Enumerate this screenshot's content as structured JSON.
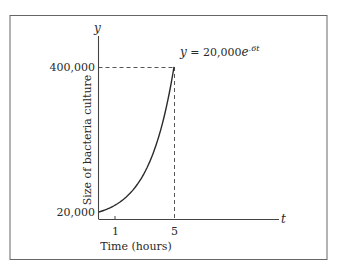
{
  "chart_data": {
    "type": "line",
    "title": "",
    "equation_label": "y = 20,000e^.6t",
    "equation": {
      "lhs": "y = 20,000e",
      "exponent": ".6t"
    },
    "xlabel": "Time (hours)",
    "ylabel": "Size of bacteria culture",
    "x_axis_var": "t",
    "y_axis_var": "y",
    "x_ticks": [
      "1",
      "5"
    ],
    "y_ticks": [
      "20,000",
      "400,000"
    ],
    "series": [
      {
        "name": "y = 20,000e^.6t",
        "x": [
          0,
          0.5,
          1,
          1.5,
          2,
          2.5,
          3,
          3.5,
          4,
          4.5,
          5
        ],
        "values": [
          20000,
          26997,
          36442,
          49192,
          66402,
          89634,
          120993,
          163325,
          220464,
          297593,
          401711
        ]
      }
    ],
    "annotations": [
      {
        "type": "dashed-guide",
        "from": [
          0,
          400000
        ],
        "to": [
          5,
          400000
        ]
      },
      {
        "type": "dashed-guide",
        "from": [
          5,
          0
        ],
        "to": [
          5,
          400000
        ]
      }
    ],
    "xlim": [
      0,
      10.5
    ],
    "ylim": [
      0,
      480000
    ],
    "grid": false,
    "legend": "none"
  },
  "colors": {
    "line": "#2a2a2a",
    "frame": "#555555",
    "background": "#ffffff"
  }
}
